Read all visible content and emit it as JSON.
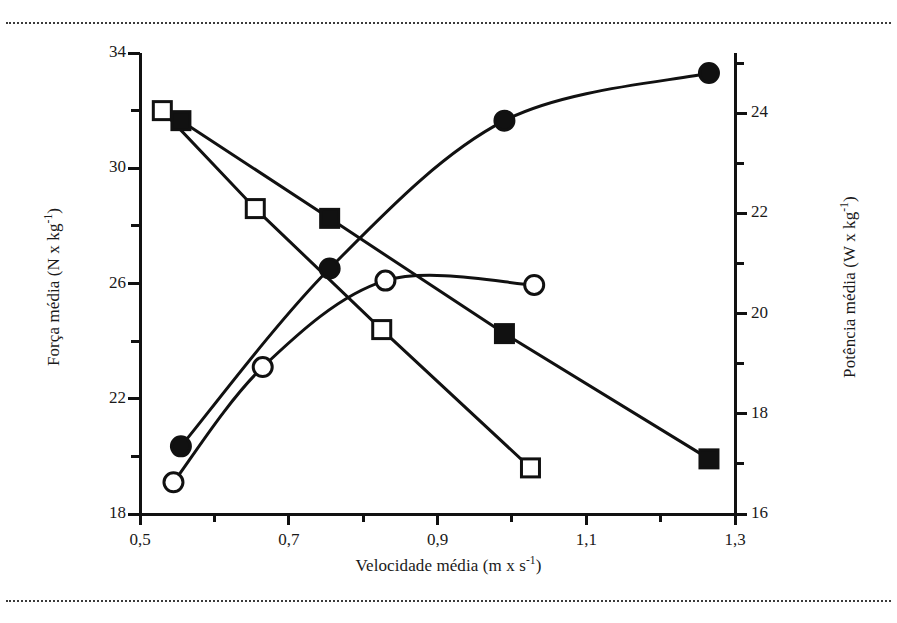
{
  "figure": {
    "top_rule": "dotted-rule",
    "bottom_rule": "dotted-rule"
  },
  "axes": {
    "x_title_main": "Velocidade média (m x s",
    "x_title_exp": "-1",
    "x_title_close": ")",
    "y_left_title_main": "Força média (N x kg",
    "y_left_title_exp": "-1",
    "y_left_title_close": ")",
    "y_right_title_main": "Potência média (W x kg",
    "y_right_title_exp": "-1",
    "y_right_title_close": ")",
    "x_ticks": [
      "0,5",
      "0,7",
      "0,9",
      "1,1",
      "1,3"
    ],
    "y_left_ticks": [
      "34",
      "30",
      "26",
      "22",
      "18"
    ],
    "y_right_ticks": [
      "24",
      "22",
      "20",
      "18",
      "16"
    ]
  },
  "chart_data": {
    "type": "line",
    "title": "",
    "xlabel": "Velocidade média (m x s-1)",
    "ylabel": "Força média (N x kg-1)",
    "ylabel_right": "Potência média (W x kg-1)",
    "xlim": [
      0.5,
      1.3
    ],
    "ylim": [
      18,
      34
    ],
    "ylim_right": [
      16,
      25.2
    ],
    "x_ticks": [
      0.5,
      0.7,
      0.9,
      1.1,
      1.3
    ],
    "y_left_ticks": [
      18,
      22,
      26,
      30,
      34
    ],
    "y_right_ticks": [
      16,
      18,
      20,
      22,
      24
    ],
    "x_minor_ticks": [
      0.6,
      0.8,
      1.0,
      1.2
    ],
    "y_left_minor_ticks": [
      20,
      24,
      28,
      32
    ],
    "y_right_minor_ticks": [
      17,
      19,
      21,
      23,
      25
    ],
    "grid": false,
    "legend": "none",
    "marker_color": "#111111",
    "line_color": "#111111",
    "series": [
      {
        "name": "Força - quadril (open square)",
        "marker": "open-square",
        "axis": "left",
        "smoothing": "straight",
        "x": [
          0.53,
          0.655,
          0.825,
          1.025
        ],
        "y": [
          32.0,
          28.6,
          24.4,
          19.6
        ]
      },
      {
        "name": "Força - joelho (open circle)",
        "marker": "open-circle",
        "axis": "left",
        "smoothing": "curved",
        "x": [
          0.545,
          0.665,
          0.83,
          1.03
        ],
        "y": [
          19.1,
          23.1,
          26.1,
          25.95
        ]
      },
      {
        "name": "Potência - quadril (filled square)",
        "marker": "filled-square",
        "axis": "right",
        "smoothing": "straight",
        "x": [
          0.555,
          0.755,
          0.99,
          1.265
        ],
        "y": [
          23.85,
          21.9,
          19.6,
          17.1
        ]
      },
      {
        "name": "Potência - joelho (filled circle)",
        "marker": "filled-circle",
        "axis": "right",
        "smoothing": "curved",
        "x": [
          0.555,
          0.755,
          0.99,
          1.265
        ],
        "y": [
          17.35,
          20.9,
          23.85,
          24.8
        ]
      }
    ]
  }
}
